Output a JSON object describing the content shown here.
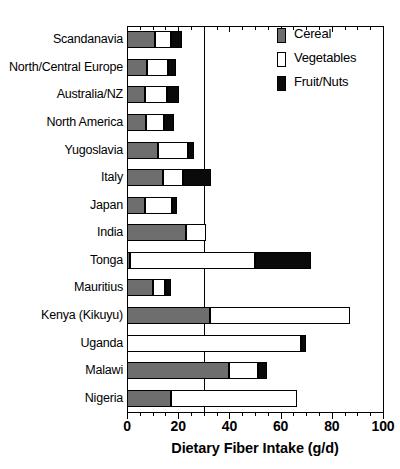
{
  "figure": {
    "top_caption": "",
    "xlabel": "Dietary Fiber Intake (g/d)"
  },
  "legend": {
    "position": "top-right",
    "items": [
      {
        "label": "Cereal",
        "color": "#6e6e6e",
        "key": "cereal"
      },
      {
        "label": "Vegetables",
        "color": "#ffffff",
        "key": "vegetables"
      },
      {
        "label": "Fruit/Nuts",
        "color": "#0a0a0a",
        "key": "fruit_nuts"
      }
    ]
  },
  "axis": {
    "x_ticks": [
      0,
      20,
      40,
      60,
      80,
      100
    ],
    "x_tick_labels": [
      "0",
      "20",
      "40",
      "60",
      "80",
      "100"
    ],
    "x_minor_step": 5,
    "xlim": [
      0,
      100
    ],
    "reference_line": 30,
    "grid": false
  },
  "chart_data": {
    "type": "bar",
    "orientation": "horizontal",
    "stacked": true,
    "title": "",
    "xlabel": "Dietary Fiber Intake (g/d)",
    "ylabel": "",
    "xlim": [
      0,
      100
    ],
    "grid": false,
    "legend_position": "top-right",
    "categories": [
      "Scandanavia",
      "North/Central Europe",
      "Australia/NZ",
      "North America",
      "Yugoslavia",
      "Italy",
      "Japan",
      "India",
      "Tonga",
      "Mauritius",
      "Kenya (Kikuyu)",
      "Uganda",
      "Malawi",
      "Nigeria"
    ],
    "series": [
      {
        "name": "Cereal",
        "color": "#6e6e6e",
        "values": [
          11,
          8,
          7,
          7.5,
          12,
          14,
          7,
          23,
          1,
          10,
          32.5,
          0,
          40,
          17
        ]
      },
      {
        "name": "Vegetables",
        "color": "#ffffff",
        "values": [
          6,
          8,
          8.5,
          7,
          12,
          8,
          10.5,
          8,
          49,
          5,
          54.5,
          68,
          11,
          49.5
        ]
      },
      {
        "name": "Fruit/Nuts",
        "color": "#0a0a0a",
        "values": [
          4.5,
          3,
          5,
          4,
          2,
          11,
          2,
          0,
          22,
          2,
          0,
          2,
          3.5,
          0
        ]
      }
    ],
    "totals": [
      21.5,
      19,
      20.5,
      18.5,
      26,
      33,
      19.5,
      31,
      72,
      17,
      87,
      70,
      54.5,
      66.5
    ]
  }
}
